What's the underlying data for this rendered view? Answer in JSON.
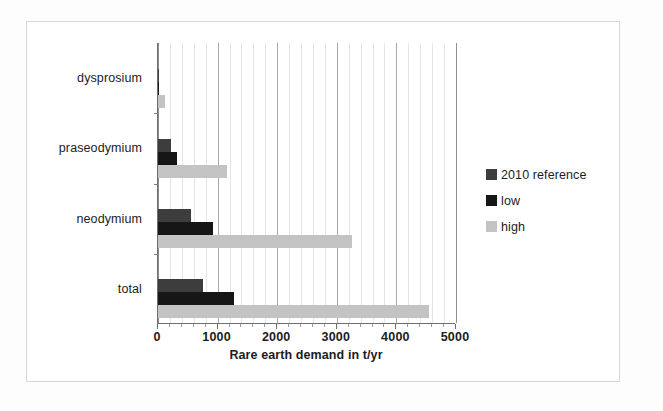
{
  "chart_data": {
    "type": "bar",
    "orientation": "horizontal",
    "title": "",
    "xlabel": "Rare earth demand in t/yr",
    "ylabel": "",
    "xlim": [
      0,
      5000
    ],
    "xticks": [
      0,
      1000,
      2000,
      3000,
      4000,
      5000
    ],
    "xtick_labels": [
      "0",
      "1000",
      "2000",
      "3000",
      "4000",
      "5000"
    ],
    "grid": true,
    "grid_axis": "x",
    "legend_position": "right",
    "categories": [
      "total",
      "neodymium",
      "praseodymium",
      "dysprosium"
    ],
    "series": [
      {
        "name": "2010 reference",
        "color": "#3d3d3d",
        "values": [
          750,
          550,
          215,
          10
        ]
      },
      {
        "name": "low",
        "color": "#161616",
        "values": [
          1280,
          920,
          320,
          20
        ]
      },
      {
        "name": "high",
        "color": "#c3c3c3",
        "values": [
          4550,
          3250,
          1150,
          110
        ]
      }
    ]
  },
  "legend": {
    "items": [
      {
        "label": "2010 reference",
        "color": "#3d3d3d"
      },
      {
        "label": "low",
        "color": "#161616"
      },
      {
        "label": "high",
        "color": "#c3c3c3"
      }
    ]
  },
  "axis": {
    "x_title": "Rare earth demand in t/yr",
    "tick_labels": [
      "0",
      "1000",
      "2000",
      "3000",
      "4000",
      "5000"
    ],
    "category_labels": [
      "dysprosium",
      "praseodymium",
      "neodymium",
      "total"
    ]
  }
}
